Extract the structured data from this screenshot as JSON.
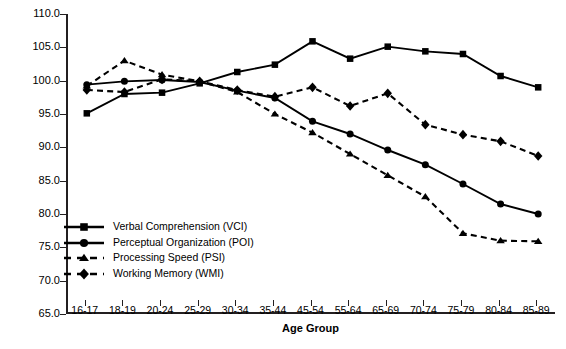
{
  "chart_data": {
    "type": "line",
    "title": "",
    "xlabel": "Age Group",
    "ylabel": "WAIS-III Educ. Adjusted Index",
    "ylim": [
      65.0,
      110.0
    ],
    "ytick_labels": [
      "65.0",
      "70.0",
      "75.0",
      "80.0",
      "85.0",
      "90.0",
      "95.0",
      "100.0",
      "105.0",
      "110.0"
    ],
    "ytick_values": [
      65,
      70,
      75,
      80,
      85,
      90,
      95,
      100,
      105,
      110
    ],
    "grid": false,
    "legend_position": "lower-left-inside",
    "categories": [
      "16-17",
      "18-19",
      "20-24",
      "25-29",
      "30-34",
      "35-44",
      "45-54",
      "55-64",
      "65-69",
      "70-74",
      "75-79",
      "80-84",
      "85-89"
    ],
    "series": [
      {
        "name": "Verbal Comprehension (VCI)",
        "marker": "square",
        "line": "solid",
        "color": "#000000",
        "values": [
          95.1,
          98.0,
          98.2,
          99.6,
          101.3,
          102.4,
          105.9,
          103.3,
          105.1,
          104.4,
          104.0,
          100.7,
          99.0
        ]
      },
      {
        "name": "Perceptual Organization (POI)",
        "marker": "circle",
        "line": "solid",
        "color": "#000000",
        "values": [
          99.4,
          99.9,
          100.1,
          99.8,
          98.5,
          97.4,
          93.9,
          92.0,
          89.6,
          87.4,
          84.5,
          81.5,
          80.0
        ]
      },
      {
        "name": "Processing Speed (PSI)",
        "marker": "triangle",
        "line": "dashed",
        "color": "#000000",
        "values": [
          99.2,
          103.0,
          100.9,
          99.9,
          98.3,
          95.0,
          92.2,
          89.0,
          85.8,
          82.6,
          77.1,
          76.0,
          75.9
        ]
      },
      {
        "name": "Working Memory (WMI)",
        "marker": "diamond",
        "line": "dashed",
        "color": "#000000",
        "values": [
          98.6,
          98.3,
          100.2,
          99.9,
          98.6,
          97.6,
          99.0,
          96.2,
          98.1,
          93.4,
          91.9,
          90.9,
          88.7
        ]
      }
    ]
  },
  "figure": {
    "caption": ""
  }
}
